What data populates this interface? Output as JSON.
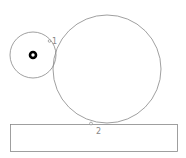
{
  "diagram": {
    "colors": {
      "stroke": "#888888",
      "fill": "#000000",
      "background": "#ffffff"
    },
    "small_circle": {
      "cx": 33,
      "cy": 55,
      "r": 23
    },
    "large_circle": {
      "cx": 107,
      "cy": 69,
      "r": 54
    },
    "hub": {
      "cx": 33,
      "cy": 55,
      "outer_r": 4.2,
      "inner_r": 1.4
    },
    "base_rect": {
      "x": 10,
      "y": 124,
      "width": 167,
      "height": 27
    },
    "contact_points": [
      {
        "id": "1",
        "label": "1",
        "x": 51,
        "y": 41
      },
      {
        "id": "2",
        "label": "2",
        "x": 91,
        "y": 123
      }
    ]
  }
}
